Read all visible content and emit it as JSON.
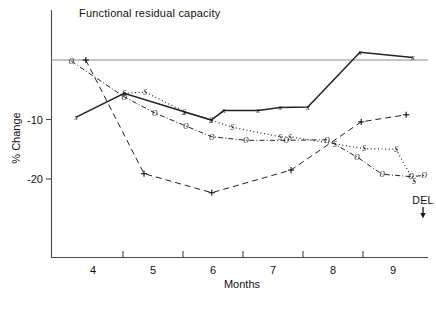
{
  "chart_data": {
    "type": "line",
    "title": "Functional residual capacity",
    "xlabel": "Months",
    "ylabel": "% Change",
    "xlim": [
      3.45,
      9.95
    ],
    "ylim": [
      -26,
      4
    ],
    "grid": false,
    "legend": "none",
    "xticks": [
      4,
      5,
      6,
      7,
      8,
      9
    ],
    "xtick_labels": [
      "4",
      "5",
      "6",
      "7",
      "8",
      "9"
    ],
    "xminor_ticks": [
      4.5,
      5.5,
      6.5,
      7.5,
      8.5
    ],
    "yticks": [
      0,
      -10,
      -20
    ],
    "ytick_labels": [
      "",
      "-10",
      "-20"
    ],
    "zero_reference_line": 0,
    "annotations": [
      {
        "text": "DEL",
        "x": 9.5,
        "y": -24.2,
        "arrow": "down"
      }
    ],
    "series": [
      {
        "name": "x",
        "marker": "x",
        "linestyle": "solid",
        "points": [
          {
            "x": 3.72,
            "y": -9.6
          },
          {
            "x": 4.52,
            "y": -5.6
          },
          {
            "x": 5.52,
            "y": -8.7
          },
          {
            "x": 5.97,
            "y": -10.1
          },
          {
            "x": 6.18,
            "y": -8.5
          },
          {
            "x": 6.75,
            "y": -8.5
          },
          {
            "x": 7.12,
            "y": -8.0
          },
          {
            "x": 7.58,
            "y": -7.9
          },
          {
            "x": 8.45,
            "y": 1.3
          },
          {
            "x": 9.33,
            "y": 0.4
          }
        ]
      },
      {
        "name": "S",
        "marker": "S",
        "linestyle": "dotted",
        "points": [
          {
            "x": 4.52,
            "y": -5.6
          },
          {
            "x": 4.87,
            "y": -5.4
          },
          {
            "x": 5.52,
            "y": -8.7
          },
          {
            "x": 5.97,
            "y": -10.1
          },
          {
            "x": 6.32,
            "y": -11.3
          },
          {
            "x": 7.12,
            "y": -12.9
          },
          {
            "x": 7.28,
            "y": -12.9
          },
          {
            "x": 8.03,
            "y": -14.1
          },
          {
            "x": 8.52,
            "y": -14.9
          },
          {
            "x": 9.05,
            "y": -15.0
          },
          {
            "x": 9.35,
            "y": -20.4
          }
        ]
      },
      {
        "name": "O",
        "marker": "O",
        "linestyle": "dashdot",
        "points": [
          {
            "x": 3.64,
            "y": -0.2
          },
          {
            "x": 4.52,
            "y": -6.2
          },
          {
            "x": 5.03,
            "y": -8.9
          },
          {
            "x": 5.55,
            "y": -11.1
          },
          {
            "x": 5.98,
            "y": -12.9
          },
          {
            "x": 6.55,
            "y": -13.5
          },
          {
            "x": 7.22,
            "y": -13.5
          },
          {
            "x": 7.9,
            "y": -13.4
          },
          {
            "x": 8.4,
            "y": -16.3
          },
          {
            "x": 8.82,
            "y": -19.2
          },
          {
            "x": 9.3,
            "y": -19.6
          },
          {
            "x": 9.52,
            "y": -19.4
          }
        ]
      },
      {
        "name": "+",
        "marker": "+",
        "linestyle": "dashed",
        "points": [
          {
            "x": 3.88,
            "y": 0.0
          },
          {
            "x": 4.85,
            "y": -19.1
          },
          {
            "x": 5.98,
            "y": -22.3
          },
          {
            "x": 7.3,
            "y": -18.5
          },
          {
            "x": 8.47,
            "y": -10.4
          },
          {
            "x": 9.22,
            "y": -9.2
          }
        ]
      }
    ]
  },
  "figure": {
    "caption": ""
  }
}
